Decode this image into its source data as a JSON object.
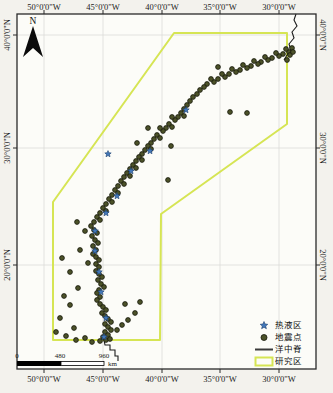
{
  "map": {
    "north_label": "N",
    "frame": {
      "x": 17,
      "y": 14,
      "w": 299,
      "h": 355
    },
    "grid_x": [
      {
        "label": "50°0'0\"W",
        "x": 44
      },
      {
        "label": "45°0'0\"W",
        "x": 103
      },
      {
        "label": "40°0'0\"W",
        "x": 162
      },
      {
        "label": "35°0'0\"W",
        "x": 220
      },
      {
        "label": "30°0'0\"W",
        "x": 279
      }
    ],
    "grid_y": [
      {
        "label": "40°0'0\"N",
        "y": 35
      },
      {
        "label": "30°0'0\"N",
        "y": 148
      },
      {
        "label": "20°0'0\"N",
        "y": 265
      }
    ],
    "study_area_polygon": [
      [
        53,
        202
      ],
      [
        174,
        33
      ],
      [
        287,
        33
      ],
      [
        287,
        124
      ],
      [
        161,
        214
      ],
      [
        160,
        340
      ],
      [
        53,
        340
      ]
    ],
    "ridge_line_top": [
      [
        296,
        14
      ],
      [
        294,
        20
      ],
      [
        297,
        26
      ],
      [
        292,
        32
      ],
      [
        294,
        38
      ],
      [
        289,
        44
      ],
      [
        291,
        50
      ],
      [
        287,
        55
      ],
      [
        284,
        60
      ]
    ],
    "ridge_line_bottom": [
      [
        104,
        340
      ],
      [
        105,
        345
      ],
      [
        110,
        345
      ],
      [
        110,
        350
      ],
      [
        115,
        350
      ],
      [
        115,
        356
      ],
      [
        118,
        356
      ],
      [
        118,
        361
      ]
    ],
    "earthquake_points": [
      [
        292,
        48
      ],
      [
        289,
        52
      ],
      [
        286,
        49
      ],
      [
        283,
        54
      ],
      [
        279,
        56
      ],
      [
        276,
        53
      ],
      [
        272,
        58
      ],
      [
        268,
        60
      ],
      [
        265,
        57
      ],
      [
        261,
        62
      ],
      [
        258,
        64
      ],
      [
        254,
        61
      ],
      [
        251,
        66
      ],
      [
        247,
        68
      ],
      [
        243,
        65
      ],
      [
        240,
        70
      ],
      [
        236,
        72
      ],
      [
        232,
        69
      ],
      [
        229,
        74
      ],
      [
        225,
        77
      ],
      [
        222,
        74
      ],
      [
        218,
        79
      ],
      [
        214,
        82
      ],
      [
        211,
        79
      ],
      [
        207,
        84
      ],
      [
        204,
        87
      ],
      [
        200,
        90
      ],
      [
        197,
        94
      ],
      [
        193,
        97
      ],
      [
        190,
        101
      ],
      [
        187,
        105
      ],
      [
        184,
        109
      ],
      [
        181,
        113
      ],
      [
        184,
        116
      ],
      [
        178,
        117
      ],
      [
        175,
        120
      ],
      [
        172,
        117
      ],
      [
        169,
        124
      ],
      [
        172,
        127
      ],
      [
        166,
        128
      ],
      [
        163,
        131
      ],
      [
        160,
        128
      ],
      [
        157,
        135
      ],
      [
        160,
        138
      ],
      [
        154,
        139
      ],
      [
        151,
        143
      ],
      [
        148,
        146
      ],
      [
        151,
        149
      ],
      [
        145,
        150
      ],
      [
        142,
        154
      ],
      [
        139,
        157
      ],
      [
        142,
        160
      ],
      [
        136,
        161
      ],
      [
        133,
        165
      ],
      [
        136,
        168
      ],
      [
        130,
        169
      ],
      [
        127,
        173
      ],
      [
        130,
        176
      ],
      [
        124,
        177
      ],
      [
        121,
        181
      ],
      [
        124,
        184
      ],
      [
        118,
        186
      ],
      [
        115,
        190
      ],
      [
        118,
        193
      ],
      [
        112,
        195
      ],
      [
        109,
        199
      ],
      [
        112,
        202
      ],
      [
        106,
        204
      ],
      [
        103,
        208
      ],
      [
        106,
        211
      ],
      [
        100,
        213
      ],
      [
        97,
        217
      ],
      [
        100,
        220
      ],
      [
        94,
        222
      ],
      [
        91,
        226
      ],
      [
        94,
        230
      ],
      [
        97,
        233
      ],
      [
        92,
        236
      ],
      [
        95,
        240
      ],
      [
        98,
        243
      ],
      [
        93,
        246
      ],
      [
        96,
        250
      ],
      [
        93,
        254
      ],
      [
        96,
        257
      ],
      [
        99,
        260
      ],
      [
        96,
        264
      ],
      [
        99,
        267
      ],
      [
        96,
        271
      ],
      [
        99,
        274
      ],
      [
        102,
        277
      ],
      [
        98,
        280
      ],
      [
        101,
        284
      ],
      [
        104,
        287
      ],
      [
        99,
        290
      ],
      [
        97,
        293
      ],
      [
        100,
        297
      ],
      [
        97,
        300
      ],
      [
        100,
        304
      ],
      [
        103,
        307
      ],
      [
        106,
        310
      ],
      [
        102,
        313
      ],
      [
        105,
        316
      ],
      [
        108,
        319
      ],
      [
        111,
        322
      ],
      [
        105,
        324
      ],
      [
        108,
        327
      ],
      [
        111,
        330
      ],
      [
        105,
        332
      ],
      [
        108,
        335
      ],
      [
        103,
        337
      ],
      [
        106,
        340
      ],
      [
        110,
        339
      ],
      [
        100,
        341
      ],
      [
        290,
        55
      ],
      [
        287,
        60
      ],
      [
        293,
        52
      ],
      [
        218,
        67
      ],
      [
        230,
        112
      ],
      [
        247,
        113
      ],
      [
        171,
        146
      ],
      [
        168,
        180
      ],
      [
        148,
        128
      ],
      [
        137,
        143
      ],
      [
        77,
        222
      ],
      [
        85,
        231
      ],
      [
        62,
        258
      ],
      [
        80,
        250
      ],
      [
        88,
        263
      ],
      [
        70,
        272
      ],
      [
        78,
        288
      ],
      [
        64,
        296
      ],
      [
        70,
        305
      ],
      [
        60,
        318
      ],
      [
        74,
        328
      ],
      [
        56,
        332
      ],
      [
        66,
        336
      ],
      [
        76,
        340
      ],
      [
        85,
        338
      ],
      [
        92,
        342
      ],
      [
        117,
        330
      ],
      [
        122,
        325
      ],
      [
        125,
        304
      ],
      [
        135,
        313
      ],
      [
        128,
        320
      ],
      [
        140,
        302
      ]
    ],
    "hydrothermal_points": [
      [
        108,
        154
      ],
      [
        150,
        151
      ],
      [
        131,
        171
      ],
      [
        117,
        196
      ],
      [
        106,
        213
      ],
      [
        95,
        231
      ],
      [
        95,
        251
      ],
      [
        99,
        272
      ],
      [
        101,
        292
      ],
      [
        106,
        318
      ],
      [
        104,
        337
      ],
      [
        186,
        110
      ]
    ],
    "colors": {
      "study_area": "#d6e554",
      "earthquake_fill": "#4c5229",
      "earthquake_stroke": "#15170a",
      "hydrothermal_fill": "#4277b8",
      "hydrothermal_stroke": "#1d3f6e",
      "ridge": "#1c1c1c",
      "grid": "#dcdcd8",
      "frame": "#2a2a2a",
      "map_bg": "#fcfcf8"
    }
  },
  "scale_bar": {
    "ticks": [
      {
        "label": "0",
        "x": 17
      },
      {
        "label": "480",
        "x": 60
      },
      {
        "label": "960",
        "x": 104
      }
    ],
    "unit": "km",
    "bar": {
      "x1": 17,
      "mid": 61,
      "x2": 104,
      "y": 361,
      "h": 5
    }
  },
  "legend": {
    "items": [
      {
        "key": "hydrothermal",
        "symbol": "star",
        "label": "热液区"
      },
      {
        "key": "earthquake",
        "symbol": "dot",
        "label": "地震点"
      },
      {
        "key": "ridge",
        "symbol": "line",
        "label": "洋中脊"
      },
      {
        "key": "study-area",
        "symbol": "rect",
        "label": "研究区"
      }
    ]
  }
}
